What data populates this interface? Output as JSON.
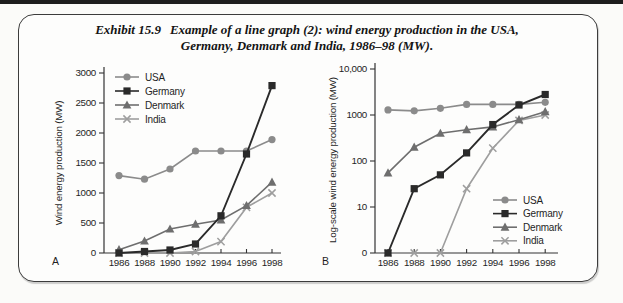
{
  "figure": {
    "exhibit_label": "Exhibit 15.9",
    "title_line1": "Example of a line graph (2): wind energy production in the USA,",
    "title_line2": "Germany, Denmark and India, 1986–98 (MW)."
  },
  "colors": {
    "usa": "#8b8b8b",
    "germany": "#2a2a2a",
    "denmark": "#6e6e6e",
    "india": "#9e9e9e",
    "axis": "#333333",
    "text": "#1f1f1f"
  },
  "chart_data": [
    {
      "id": "A",
      "type": "line",
      "scale": "linear",
      "corner_label": "A",
      "ylabel": "Wind energy production (MW)",
      "x": [
        1986,
        1988,
        1990,
        1992,
        1994,
        1996,
        1998
      ],
      "x_labels": [
        "1986",
        "1988",
        "1990",
        "1992",
        "1994",
        "1996",
        "1998"
      ],
      "ylim": [
        0,
        3000
      ],
      "yticks": [
        0,
        500,
        1000,
        1500,
        2000,
        2500,
        3000
      ],
      "ytick_labels": [
        "0",
        "500",
        "1000",
        "1500",
        "2000",
        "2500",
        "3000"
      ],
      "grid": false,
      "legend_position": "top-left",
      "series": [
        {
          "name": "USA",
          "marker": "circle",
          "color": "#8b8b8b",
          "values": [
            1290,
            1230,
            1400,
            1700,
            1700,
            1700,
            1890
          ]
        },
        {
          "name": "Germany",
          "marker": "square",
          "color": "#2a2a2a",
          "values": [
            0,
            25,
            50,
            150,
            620,
            1650,
            2790
          ]
        },
        {
          "name": "Denmark",
          "marker": "triangle",
          "color": "#6e6e6e",
          "values": [
            55,
            200,
            400,
            480,
            550,
            790,
            1180
          ]
        },
        {
          "name": "India",
          "marker": "x",
          "color": "#9e9e9e",
          "values": [
            0,
            0,
            0,
            25,
            190,
            760,
            1000
          ]
        }
      ]
    },
    {
      "id": "B",
      "type": "line",
      "scale": "log",
      "corner_label": "B",
      "ylabel": "Log-scale wind energy production (MW)",
      "x": [
        1986,
        1988,
        1990,
        1992,
        1994,
        1996,
        1998
      ],
      "x_labels": [
        "1986",
        "1988",
        "1990",
        "1992",
        "1994",
        "1996",
        "1998"
      ],
      "ytick_labels": [
        "0",
        "10",
        "100",
        "1000",
        "10,000"
      ],
      "grid": false,
      "legend_position": "bottom-right",
      "series": [
        {
          "name": "USA",
          "marker": "circle",
          "color": "#8b8b8b",
          "values": [
            1290,
            1230,
            1400,
            1700,
            1700,
            1700,
            1890
          ]
        },
        {
          "name": "Germany",
          "marker": "square",
          "color": "#2a2a2a",
          "values": [
            0,
            25,
            50,
            150,
            620,
            1650,
            2790
          ]
        },
        {
          "name": "Denmark",
          "marker": "triangle",
          "color": "#6e6e6e",
          "values": [
            55,
            200,
            400,
            480,
            550,
            790,
            1180
          ]
        },
        {
          "name": "India",
          "marker": "x",
          "color": "#9e9e9e",
          "values": [
            0,
            0,
            0,
            25,
            190,
            760,
            1000
          ]
        }
      ]
    }
  ]
}
